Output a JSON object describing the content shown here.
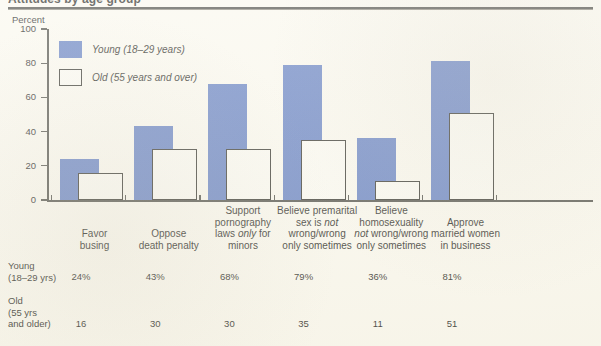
{
  "figure": {
    "title_cropped": "Attitudes by age group",
    "y_axis_title": "Percent"
  },
  "legend": {
    "young_label": "Young (18–29 years)",
    "old_label": "Old (55 years and over)"
  },
  "table": {
    "young_row_line1": "Young",
    "young_row_line2": "(18–29 yrs)",
    "old_row_line1": "Old",
    "old_row_line2": "(55 yrs",
    "old_row_line3": "and older)",
    "young_cells": [
      "24%",
      "43%",
      "68%",
      "79%",
      "36%",
      "81%"
    ],
    "old_cells": [
      "16",
      "30",
      "30",
      "35",
      "11",
      "51"
    ]
  },
  "colors": {
    "young_bar": "#6480c2",
    "old_bar_fill": "#fbfaf2",
    "old_bar_stroke": "#33332c",
    "axis": "#4e4e47",
    "background": "#faf8ee",
    "text": "#1f1f1a"
  },
  "chart_data": {
    "type": "bar",
    "title": "Attitudes by age group",
    "xlabel": "",
    "ylabel": "Percent",
    "ylim": [
      0,
      100
    ],
    "yticks": [
      0,
      20,
      40,
      60,
      80,
      100
    ],
    "grid": false,
    "legend_position": "upper-left-inside",
    "categories": [
      "Favor busing",
      "Oppose death penalty",
      "Support pornography laws only for minors",
      "Believe premarital sex is not wrong/wrong only sometimes",
      "Believe homosexuality not wrong/wrong only sometimes",
      "Approve married women in business"
    ],
    "category_label_lines": [
      [
        "Favor",
        "busing"
      ],
      [
        "Oppose",
        "death penalty"
      ],
      [
        "Support",
        "pornography",
        "laws |only| for",
        "minors"
      ],
      [
        "Believe premarital",
        "sex is |not|",
        "wrong/wrong",
        "only sometimes"
      ],
      [
        "Believe",
        "homosexuality",
        "|not| wrong/wrong",
        "only sometimes"
      ],
      [
        "Approve",
        "married women",
        "in business"
      ]
    ],
    "series": [
      {
        "name": "Young (18–29 years)",
        "values": [
          24,
          43,
          68,
          79,
          36,
          81
        ],
        "color": "#6480c2"
      },
      {
        "name": "Old (55 years and over)",
        "values": [
          16,
          30,
          30,
          35,
          11,
          51
        ],
        "color": "#fbfaf2"
      }
    ]
  }
}
